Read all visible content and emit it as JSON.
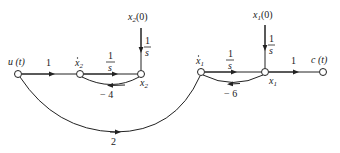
{
  "diagram": {
    "type": "signal-flow-graph",
    "nodes": [
      {
        "id": "u",
        "label": "u (t)",
        "x": 18,
        "y": 74
      },
      {
        "id": "x2dot",
        "label": "ẋ₂",
        "x": 80,
        "y": 74
      },
      {
        "id": "x2",
        "label": "x₂",
        "x": 141,
        "y": 74
      },
      {
        "id": "x1dot",
        "label": "ẋ₁",
        "x": 201,
        "y": 72
      },
      {
        "id": "x1",
        "label": "x₁",
        "x": 265,
        "y": 72
      },
      {
        "id": "c",
        "label": "c (t)",
        "x": 323,
        "y": 72
      }
    ],
    "initial_conditions": [
      {
        "id": "x2_0",
        "label": "x₂(0)",
        "gain": "1/s",
        "target": "x2"
      },
      {
        "id": "x1_0",
        "label": "x₁(0)",
        "gain": "1/s",
        "target": "x1"
      }
    ],
    "edges": [
      {
        "from": "u",
        "to": "x2dot",
        "gain": "1"
      },
      {
        "from": "x2dot",
        "to": "x2",
        "gain": "1/s"
      },
      {
        "from": "x2",
        "to": "x2dot",
        "gain": "−4"
      },
      {
        "from": "u",
        "to": "x1dot",
        "gain": "2"
      },
      {
        "from": "x1dot",
        "to": "x1",
        "gain": "1/s"
      },
      {
        "from": "x1",
        "to": "x1dot",
        "gain": "−6"
      },
      {
        "from": "x1",
        "to": "c",
        "gain": "1"
      }
    ],
    "labels": {
      "u": "u (t)",
      "x2dot_base": "x",
      "x2dot_sub": "2",
      "x2_base": "x",
      "x2_sub": "2",
      "x2_0_base": "x",
      "x2_0_sub": "2",
      "x2_0_tail": "(0)",
      "x1dot_base": "x",
      "x1dot_sub": "1",
      "x1_base": "x",
      "x1_sub": "1",
      "x1_0_base": "x",
      "x1_0_sub": "1",
      "x1_0_tail": "(0)",
      "c": "c (t)"
    },
    "gains": {
      "u_to_x2dot": "1",
      "integrator_num": "1",
      "integrator_den": "s",
      "fb_x2": "− 4",
      "u_to_x1dot": "2",
      "fb_x1": "− 6",
      "x1_to_c": "1"
    }
  }
}
